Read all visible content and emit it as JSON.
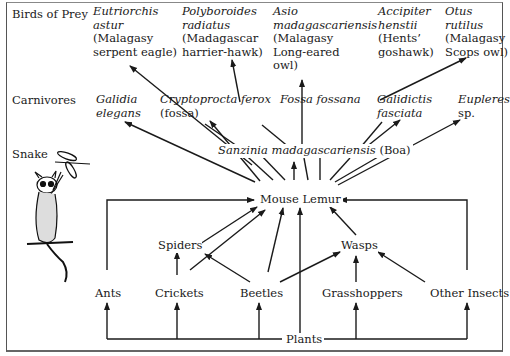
{
  "levels": {
    "birds": "Birds of Prey",
    "carnivores": "Carnivores",
    "snake": "Snake"
  },
  "birds": [
    {
      "sci": [
        "Eutriorchis",
        "astur"
      ],
      "common": [
        "(Malagasy",
        "serpent eagle)"
      ]
    },
    {
      "sci": [
        "Polyboroides",
        "radiatus"
      ],
      "common": [
        "(Madagascar",
        "harrier-hawk)"
      ]
    },
    {
      "sci": [
        "Asio",
        "madagascariensis"
      ],
      "common": [
        "(Malagasy",
        "Long-eared",
        "owl)"
      ]
    },
    {
      "sci": [
        "Accipiter",
        "henstii"
      ],
      "common": [
        "(Hents’",
        "goshawk)"
      ]
    },
    {
      "sci": [
        "Otus",
        "rutilus"
      ],
      "common": [
        "(Malagasy",
        "Scops owl)"
      ]
    }
  ],
  "carnivores": [
    {
      "sci": [
        "Galidia",
        "elegans"
      ],
      "common": []
    },
    {
      "sci": [
        "Cryptoprocta ferox"
      ],
      "common": [
        "(fossa)"
      ]
    },
    {
      "sci": [
        "Fossa fossana"
      ],
      "common": []
    },
    {
      "sci": [
        "Galidictis",
        "fasciata"
      ],
      "common": []
    },
    {
      "sci": [
        "Eupleres"
      ],
      "common": [
        "sp."
      ]
    }
  ],
  "snake": {
    "sci": "Sanzinia madagascariensis",
    "common": "(Boa)"
  },
  "center": "Mouse Lemur",
  "mid_prey": [
    "Spiders",
    "Wasps"
  ],
  "insects": [
    "Ants",
    "Crickets",
    "Beetles",
    "Grasshoppers",
    "Other Insects"
  ],
  "base": "Plants",
  "colors": {
    "line": "#1a1a1a",
    "border": "#555555",
    "background": "#ffffff"
  }
}
